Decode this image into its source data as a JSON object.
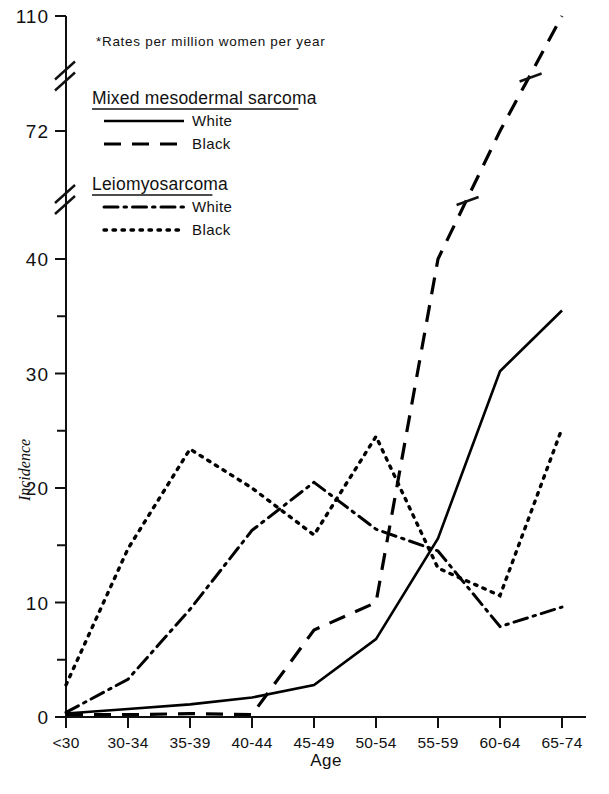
{
  "chart_data": {
    "type": "line",
    "title": "",
    "footnote": "*Rates per million women per year",
    "xlabel": "Age",
    "ylabel": "Incidence",
    "categories": [
      "<30",
      "30-34",
      "35-39",
      "40-44",
      "45-49",
      "50-54",
      "55-59",
      "60-64",
      "65-74"
    ],
    "ytick_labels": [
      "0",
      "10",
      "20",
      "30",
      "40",
      "72",
      "110"
    ],
    "ytick_values": [
      0,
      10,
      20,
      30,
      40,
      72,
      110
    ],
    "yminor_values": [
      5,
      15,
      25,
      35
    ],
    "ylim": [
      0,
      110
    ],
    "axis_breaks": [
      {
        "between": [
          40,
          72
        ]
      },
      {
        "between": [
          72,
          110
        ]
      }
    ],
    "grid": false,
    "legend_position": "upper-left-inside",
    "legend_groups": [
      {
        "title": "Mixed mesodermal sarcoma",
        "entries": [
          {
            "label": "White",
            "style": "solid"
          },
          {
            "label": "Black",
            "style": "dashed"
          }
        ]
      },
      {
        "title": "Leiomyosarcoma",
        "entries": [
          {
            "label": "White",
            "style": "dash-dot"
          },
          {
            "label": "Black",
            "style": "dotted"
          }
        ]
      }
    ],
    "series": [
      {
        "name": "Mixed mesodermal sarcoma - White",
        "style": "solid",
        "color": "#000000",
        "values": [
          0.3,
          0.7,
          1.1,
          1.7,
          2.8,
          6.8,
          15.6,
          30.2,
          35.5
        ]
      },
      {
        "name": "Mixed mesodermal sarcoma - Black",
        "style": "dashed",
        "color": "#000000",
        "values": [
          0.2,
          0.2,
          0.3,
          0.2,
          7.6,
          10.0,
          40.0,
          72.0,
          110.0
        ]
      },
      {
        "name": "Leiomyosarcoma - White",
        "style": "dash-dot",
        "color": "#000000",
        "values": [
          0.4,
          3.3,
          9.4,
          16.3,
          20.5,
          16.4,
          14.5,
          7.9,
          9.6
        ]
      },
      {
        "name": "Leiomyosarcoma - Black",
        "style": "dotted",
        "color": "#000000",
        "values": [
          2.8,
          14.7,
          23.4,
          20.0,
          15.9,
          24.5,
          13.0,
          10.6,
          25.2
        ]
      }
    ]
  }
}
